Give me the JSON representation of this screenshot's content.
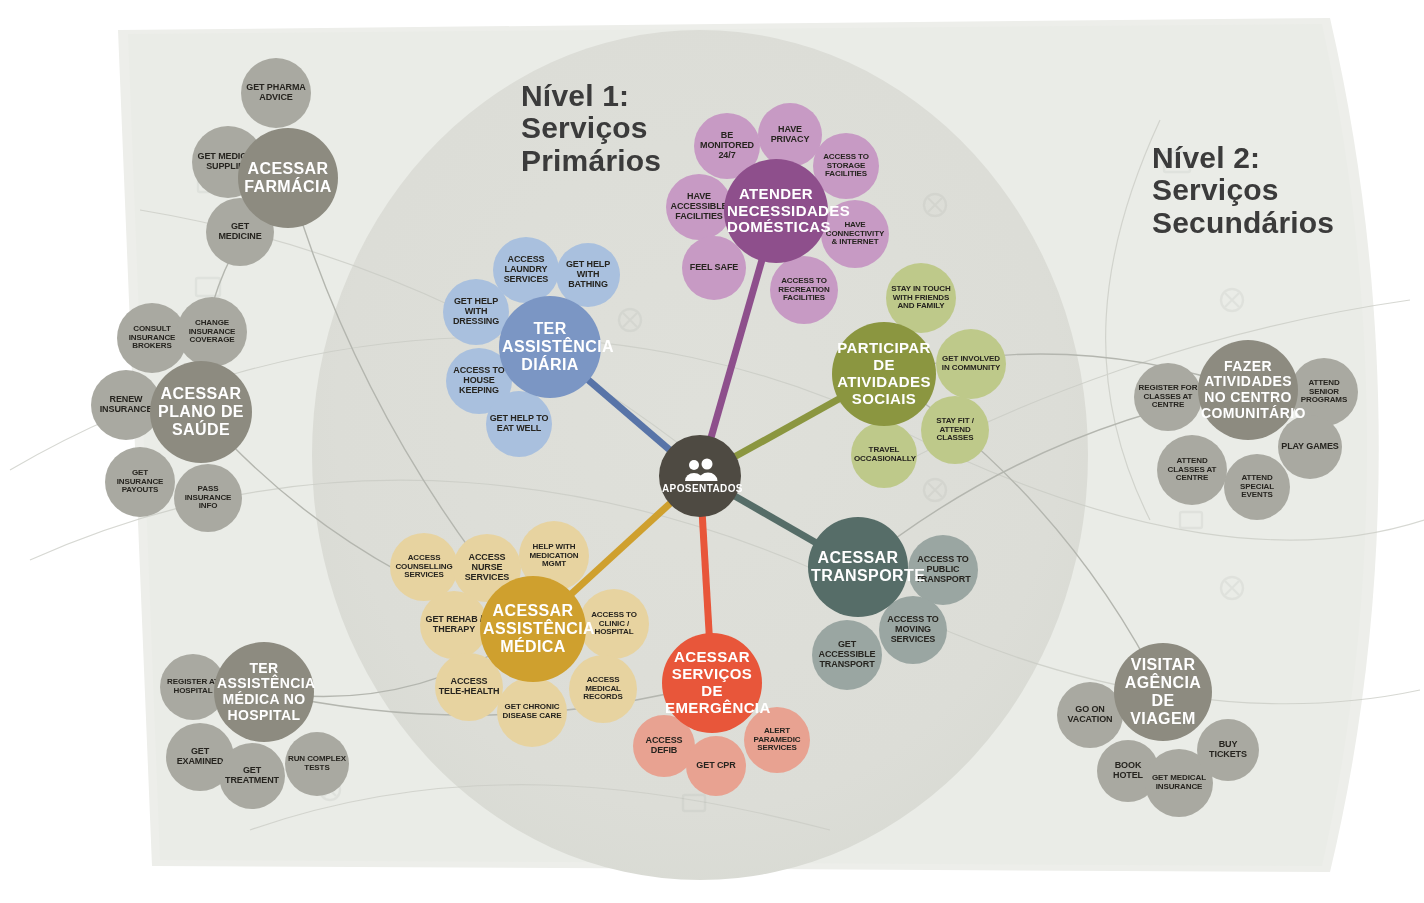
{
  "meta": {
    "center_label": "APOSENTADOS",
    "center_icon": "people-group-icon"
  },
  "headings": {
    "level1": "Nível 1:\nServiços\nPrimários",
    "level2": "Nível 2:\nServiços\nSecundários"
  },
  "colors": {
    "background": "#ffffff",
    "paper": "#eceeea",
    "paper_inner": "#e4e6e1",
    "level1_disc": "#dcddd7",
    "center": "#4e4a42",
    "grey_hub": "#8d8b80",
    "grey_sat": "#a9a9a1",
    "blue_hub": "#7b96c4",
    "blue_sat": "#a9c0de",
    "purple_hub": "#8e4f8c",
    "purple_sat": "#c79ac4",
    "olive_hub": "#8b9640",
    "olive_sat": "#bec98a",
    "teal_hub": "#566d68",
    "teal_sat": "#9aa6a2",
    "gold_hub": "#cfa02e",
    "gold_sat": "#e7d3a0",
    "red_hub": "#e8563a",
    "red_sat": "#e8a291"
  },
  "clusters": [
    {
      "id": "farmacia",
      "level": 2,
      "palette": "grey",
      "hub": {
        "label": "ACESSAR FARMÁCIA",
        "x": 288,
        "y": 178,
        "r": 50,
        "font": 16
      },
      "satellites": [
        {
          "label": "GET PHARMA ADVICE",
          "x": 276,
          "y": 93,
          "r": 35,
          "font": 9
        },
        {
          "label": "GET MEDICAL SUPPLIES",
          "x": 228,
          "y": 162,
          "r": 36,
          "font": 9
        },
        {
          "label": "GET MEDICINE",
          "x": 240,
          "y": 232,
          "r": 34,
          "font": 9
        }
      ]
    },
    {
      "id": "plano-saude",
      "level": 2,
      "palette": "grey",
      "hub": {
        "label": "ACESSAR PLANO DE SAÚDE",
        "x": 201,
        "y": 412,
        "r": 51,
        "font": 16
      },
      "satellites": [
        {
          "label": "CONSULT INSURANCE BROKERS",
          "x": 152,
          "y": 338,
          "r": 35,
          "font": 8
        },
        {
          "label": "CHANGE INSURANCE COVERAGE",
          "x": 212,
          "y": 332,
          "r": 35,
          "font": 8
        },
        {
          "label": "RENEW INSURANCE",
          "x": 126,
          "y": 405,
          "r": 35,
          "font": 9
        },
        {
          "label": "GET INSURANCE PAYOUTS",
          "x": 140,
          "y": 482,
          "r": 35,
          "font": 8
        },
        {
          "label": "PASS INSURANCE INFO",
          "x": 208,
          "y": 498,
          "r": 34,
          "font": 8
        }
      ]
    },
    {
      "id": "hospital",
      "level": 2,
      "palette": "grey",
      "hub": {
        "label": "TER ASSISTÊNCIA MÉDICA NO HOSPITAL",
        "x": 264,
        "y": 692,
        "r": 50,
        "font": 14
      },
      "satellites": [
        {
          "label": "REGISTER AT HOSPITAL",
          "x": 193,
          "y": 687,
          "r": 33,
          "font": 8
        },
        {
          "label": "GET EXAMINED",
          "x": 200,
          "y": 757,
          "r": 34,
          "font": 9
        },
        {
          "label": "GET TREATMENT",
          "x": 252,
          "y": 776,
          "r": 33,
          "font": 9
        },
        {
          "label": "RUN COMPLEX TESTS",
          "x": 317,
          "y": 764,
          "r": 32,
          "font": 8
        }
      ]
    },
    {
      "id": "assistencia-diaria",
      "level": 1,
      "palette": "blue",
      "hub": {
        "label": "TER ASSISTÊNCIA DIÁRIA",
        "x": 550,
        "y": 347,
        "r": 51,
        "font": 16
      },
      "satellites": [
        {
          "label": "ACCESS LAUNDRY SERVICES",
          "x": 526,
          "y": 270,
          "r": 33,
          "font": 9
        },
        {
          "label": "GET HELP WITH BATHING",
          "x": 588,
          "y": 275,
          "r": 32,
          "font": 9
        },
        {
          "label": "GET HELP WITH DRESSING",
          "x": 476,
          "y": 312,
          "r": 33,
          "font": 9
        },
        {
          "label": "ACCESS TO HOUSE KEEPING",
          "x": 479,
          "y": 381,
          "r": 33,
          "font": 9
        },
        {
          "label": "GET HELP TO EAT WELL",
          "x": 519,
          "y": 424,
          "r": 33,
          "font": 9
        }
      ]
    },
    {
      "id": "necessidades-domesticas",
      "level": 1,
      "palette": "purple",
      "hub": {
        "label": "ATENDER NECESSIDADES DOMÉSTICAS",
        "x": 776,
        "y": 211,
        "r": 52,
        "font": 15
      },
      "satellites": [
        {
          "label": "BE MONITORED 24/7",
          "x": 727,
          "y": 146,
          "r": 33,
          "font": 9
        },
        {
          "label": "HAVE PRIVACY",
          "x": 790,
          "y": 135,
          "r": 32,
          "font": 9
        },
        {
          "label": "ACCESS TO STORAGE FACILITIES",
          "x": 846,
          "y": 166,
          "r": 33,
          "font": 8
        },
        {
          "label": "HAVE ACCESSIBLE FACILITIES",
          "x": 699,
          "y": 207,
          "r": 33,
          "font": 9
        },
        {
          "label": "HAVE CONNECTIVITY & INTERNET",
          "x": 855,
          "y": 234,
          "r": 34,
          "font": 8
        },
        {
          "label": "FEEL SAFE",
          "x": 714,
          "y": 268,
          "r": 32,
          "font": 9
        },
        {
          "label": "ACCESS TO RECREATION FACILITIES",
          "x": 804,
          "y": 290,
          "r": 34,
          "font": 8
        }
      ]
    },
    {
      "id": "atividades-sociais",
      "level": 1,
      "palette": "olive",
      "hub": {
        "label": "PARTICIPAR DE ATIVIDADES SOCIAIS",
        "x": 884,
        "y": 374,
        "r": 52,
        "font": 15
      },
      "satellites": [
        {
          "label": "STAY IN TOUCH WITH FRIENDS AND FAMILY",
          "x": 921,
          "y": 298,
          "r": 35,
          "font": 8
        },
        {
          "label": "GET INVOLVED IN COMMUNITY",
          "x": 971,
          "y": 364,
          "r": 35,
          "font": 8
        },
        {
          "label": "STAY FIT / ATTEND CLASSES",
          "x": 955,
          "y": 430,
          "r": 34,
          "font": 8
        },
        {
          "label": "TRAVEL OCCASIONALLY",
          "x": 884,
          "y": 455,
          "r": 33,
          "font": 8
        }
      ]
    },
    {
      "id": "transporte",
      "level": 1,
      "palette": "teal",
      "hub": {
        "label": "ACESSAR TRANSPORTE",
        "x": 858,
        "y": 567,
        "r": 50,
        "font": 16
      },
      "satellites": [
        {
          "label": "ACCESS TO PUBLIC TRANSPORT",
          "x": 943,
          "y": 570,
          "r": 35,
          "font": 9
        },
        {
          "label": "ACCESS TO MOVING SERVICES",
          "x": 913,
          "y": 630,
          "r": 34,
          "font": 9
        },
        {
          "label": "GET ACCESSIBLE TRANSPORT",
          "x": 847,
          "y": 655,
          "r": 35,
          "font": 9
        }
      ]
    },
    {
      "id": "assistencia-medica",
      "level": 1,
      "palette": "gold",
      "hub": {
        "label": "ACESSAR ASSISTÊNCIA MÉDICA",
        "x": 533,
        "y": 629,
        "r": 53,
        "font": 16
      },
      "satellites": [
        {
          "label": "ACCESS COUNSELLING SERVICES",
          "x": 424,
          "y": 567,
          "r": 34,
          "font": 8
        },
        {
          "label": "ACCESS NURSE SERVICES",
          "x": 487,
          "y": 568,
          "r": 34,
          "font": 9
        },
        {
          "label": "HELP WITH MEDICATION MGMT",
          "x": 554,
          "y": 556,
          "r": 35,
          "font": 8
        },
        {
          "label": "GET REHAB / THERAPY",
          "x": 454,
          "y": 625,
          "r": 34,
          "font": 9
        },
        {
          "label": "ACCESS TO CLINIC / HOSPITAL",
          "x": 614,
          "y": 624,
          "r": 35,
          "font": 8
        },
        {
          "label": "ACCESS TELE-HEALTH",
          "x": 469,
          "y": 687,
          "r": 34,
          "font": 9
        },
        {
          "label": "GET CHRONIC DISEASE CARE",
          "x": 532,
          "y": 712,
          "r": 35,
          "font": 8
        },
        {
          "label": "ACCESS MEDICAL RECORDS",
          "x": 603,
          "y": 689,
          "r": 34,
          "font": 8
        }
      ]
    },
    {
      "id": "emergencia",
      "level": 1,
      "palette": "red",
      "hub": {
        "label": "ACESSAR SERVIÇOS DE EMERGÊNCIA",
        "x": 712,
        "y": 683,
        "r": 50,
        "font": 15
      },
      "satellites": [
        {
          "label": "ACCESS DEFIB",
          "x": 664,
          "y": 746,
          "r": 31,
          "font": 9
        },
        {
          "label": "GET CPR",
          "x": 716,
          "y": 766,
          "r": 30,
          "font": 9
        },
        {
          "label": "ALERT PARAMEDIC SERVICES",
          "x": 777,
          "y": 740,
          "r": 33,
          "font": 8
        }
      ]
    },
    {
      "id": "centro-comunitario",
      "level": 2,
      "palette": "grey",
      "hub": {
        "label": "FAZER ATIVIDADES NO CENTRO COMUNITÁRIO",
        "x": 1248,
        "y": 390,
        "r": 50,
        "font": 14
      },
      "satellites": [
        {
          "label": "REGISTER FOR CLASSES AT CENTRE",
          "x": 1168,
          "y": 397,
          "r": 34,
          "font": 8
        },
        {
          "label": "ATTEND SENIOR PROGRAMS",
          "x": 1324,
          "y": 392,
          "r": 34,
          "font": 8
        },
        {
          "label": "ATTEND CLASSES AT CENTRE",
          "x": 1192,
          "y": 470,
          "r": 35,
          "font": 8
        },
        {
          "label": "PLAY GAMES",
          "x": 1310,
          "y": 447,
          "r": 32,
          "font": 9
        },
        {
          "label": "ATTEND SPECIAL EVENTS",
          "x": 1257,
          "y": 487,
          "r": 33,
          "font": 8
        }
      ]
    },
    {
      "id": "agencia-viagem",
      "level": 2,
      "palette": "grey",
      "hub": {
        "label": "VISITAR AGÊNCIA DE VIAGEM",
        "x": 1163,
        "y": 692,
        "r": 49,
        "font": 16
      },
      "satellites": [
        {
          "label": "GO ON VACATION",
          "x": 1090,
          "y": 715,
          "r": 33,
          "font": 9
        },
        {
          "label": "BOOK HOTEL",
          "x": 1128,
          "y": 771,
          "r": 31,
          "font": 9
        },
        {
          "label": "GET MEDICAL INSURANCE",
          "x": 1179,
          "y": 783,
          "r": 34,
          "font": 8
        },
        {
          "label": "BUY TICKETS",
          "x": 1228,
          "y": 750,
          "r": 31,
          "font": 9
        }
      ]
    }
  ],
  "spokes": [
    {
      "from": "center",
      "to": "assistencia-diaria",
      "color": "#5874a8"
    },
    {
      "from": "center",
      "to": "necessidades-domesticas",
      "color": "#8e4f8c"
    },
    {
      "from": "center",
      "to": "atividades-sociais",
      "color": "#8b9640"
    },
    {
      "from": "center",
      "to": "transporte",
      "color": "#566d68"
    },
    {
      "from": "center",
      "to": "assistencia-medica",
      "color": "#cfa02e"
    },
    {
      "from": "center",
      "to": "emergencia",
      "color": "#e8563a"
    }
  ],
  "links": [
    {
      "from": "farmacia",
      "to": "assistencia-medica"
    },
    {
      "from": "plano-saude",
      "to": "assistencia-medica"
    },
    {
      "from": "hospital",
      "to": "assistencia-medica"
    },
    {
      "from": "hospital",
      "to": "emergencia"
    },
    {
      "from": "centro-comunitario",
      "to": "atividades-sociais"
    },
    {
      "from": "agencia-viagem",
      "to": "atividades-sociais"
    },
    {
      "from": "farmacia",
      "to": "plano-saude"
    },
    {
      "from": "centro-comunitario",
      "to": "transporte"
    }
  ]
}
